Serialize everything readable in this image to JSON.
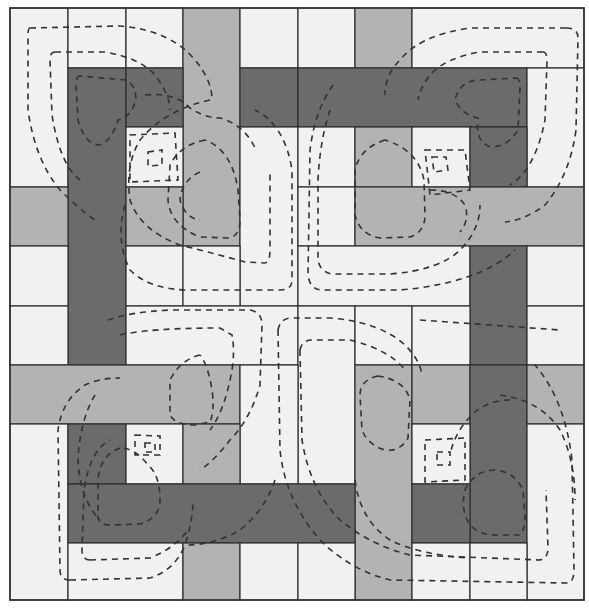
{
  "diagram": {
    "type": "quilt-pattern",
    "caption": "",
    "colors": {
      "white": "#f1f1f1",
      "light": "#b3b3b3",
      "dark": "#6b6b6b",
      "line": "#2e2e2e",
      "stitch": "#333333"
    },
    "grid": {
      "cols": [
        10,
        68,
        126,
        183,
        240,
        298,
        355,
        412,
        470,
        527,
        584
      ],
      "rows": [
        8,
        68,
        127,
        187,
        246,
        306,
        365,
        424,
        484,
        543,
        600
      ]
    },
    "patches": [
      {
        "c": [
          0,
          1
        ],
        "r": [
          0,
          3
        ],
        "t": "white"
      },
      {
        "c": [
          1,
          2
        ],
        "r": [
          0,
          1
        ],
        "t": "white"
      },
      {
        "c": [
          2,
          3
        ],
        "r": [
          0,
          1
        ],
        "t": "white"
      },
      {
        "c": [
          3,
          4
        ],
        "r": [
          0,
          4
        ],
        "t": "light"
      },
      {
        "c": [
          4,
          5
        ],
        "r": [
          0,
          1
        ],
        "t": "white"
      },
      {
        "c": [
          5,
          6
        ],
        "r": [
          0,
          1
        ],
        "t": "white"
      },
      {
        "c": [
          6,
          7
        ],
        "r": [
          0,
          1
        ],
        "t": "light"
      },
      {
        "c": [
          7,
          10
        ],
        "r": [
          0,
          1
        ],
        "t": "white"
      },
      {
        "c": [
          1,
          2
        ],
        "r": [
          1,
          6
        ],
        "t": "dark"
      },
      {
        "c": [
          2,
          3
        ],
        "r": [
          1,
          2
        ],
        "t": "dark"
      },
      {
        "c": [
          4,
          5
        ],
        "r": [
          1,
          2
        ],
        "t": "dark"
      },
      {
        "c": [
          5,
          9
        ],
        "r": [
          1,
          2
        ],
        "t": "dark"
      },
      {
        "c": [
          9,
          10
        ],
        "r": [
          1,
          3
        ],
        "t": "white"
      },
      {
        "c": [
          2,
          3
        ],
        "r": [
          2,
          3
        ],
        "t": "white"
      },
      {
        "c": [
          4,
          5
        ],
        "r": [
          2,
          5
        ],
        "t": "white"
      },
      {
        "c": [
          5,
          6
        ],
        "r": [
          2,
          3
        ],
        "t": "white"
      },
      {
        "c": [
          6,
          7
        ],
        "r": [
          2,
          3
        ],
        "t": "light"
      },
      {
        "c": [
          7,
          8
        ],
        "r": [
          2,
          3
        ],
        "t": "white"
      },
      {
        "c": [
          8,
          9
        ],
        "r": [
          2,
          3
        ],
        "t": "dark"
      },
      {
        "c": [
          0,
          1
        ],
        "r": [
          3,
          4
        ],
        "t": "light"
      },
      {
        "c": [
          2,
          3
        ],
        "r": [
          3,
          4
        ],
        "t": "light"
      },
      {
        "c": [
          5,
          6
        ],
        "r": [
          3,
          4
        ],
        "t": "white"
      },
      {
        "c": [
          6,
          10
        ],
        "r": [
          3,
          4
        ],
        "t": "light"
      },
      {
        "c": [
          0,
          1
        ],
        "r": [
          4,
          5
        ],
        "t": "white"
      },
      {
        "c": [
          2,
          3
        ],
        "r": [
          4,
          5
        ],
        "t": "white"
      },
      {
        "c": [
          3,
          4
        ],
        "r": [
          4,
          5
        ],
        "t": "white"
      },
      {
        "c": [
          5,
          8
        ],
        "r": [
          4,
          5
        ],
        "t": "white"
      },
      {
        "c": [
          8,
          9
        ],
        "r": [
          4,
          6
        ],
        "t": "dark"
      },
      {
        "c": [
          9,
          10
        ],
        "r": [
          4,
          5
        ],
        "t": "white"
      },
      {
        "c": [
          0,
          1
        ],
        "r": [
          5,
          6
        ],
        "t": "white"
      },
      {
        "c": [
          2,
          5
        ],
        "r": [
          5,
          6
        ],
        "t": "white"
      },
      {
        "c": [
          5,
          6
        ],
        "r": [
          5,
          8
        ],
        "t": "white"
      },
      {
        "c": [
          6,
          7
        ],
        "r": [
          5,
          6
        ],
        "t": "white"
      },
      {
        "c": [
          7,
          8
        ],
        "r": [
          5,
          6
        ],
        "t": "white"
      },
      {
        "c": [
          9,
          10
        ],
        "r": [
          5,
          6
        ],
        "t": "white"
      },
      {
        "c": [
          0,
          4
        ],
        "r": [
          6,
          7
        ],
        "t": "light"
      },
      {
        "c": [
          4,
          5
        ],
        "r": [
          6,
          8
        ],
        "t": "white"
      },
      {
        "c": [
          6,
          7
        ],
        "r": [
          6,
          10
        ],
        "t": "light"
      },
      {
        "c": [
          7,
          8
        ],
        "r": [
          6,
          7
        ],
        "t": "light"
      },
      {
        "c": [
          8,
          9
        ],
        "r": [
          6,
          9
        ],
        "t": "dark"
      },
      {
        "c": [
          9,
          10
        ],
        "r": [
          6,
          7
        ],
        "t": "light"
      },
      {
        "c": [
          0,
          1
        ],
        "r": [
          7,
          10
        ],
        "t": "white"
      },
      {
        "c": [
          1,
          2
        ],
        "r": [
          7,
          8
        ],
        "t": "dark"
      },
      {
        "c": [
          2,
          3
        ],
        "r": [
          7,
          8
        ],
        "t": "white"
      },
      {
        "c": [
          3,
          4
        ],
        "r": [
          7,
          8
        ],
        "t": "light"
      },
      {
        "c": [
          7,
          8
        ],
        "r": [
          7,
          8
        ],
        "t": "white"
      },
      {
        "c": [
          9,
          10
        ],
        "r": [
          7,
          10
        ],
        "t": "white"
      },
      {
        "c": [
          1,
          6
        ],
        "r": [
          8,
          9
        ],
        "t": "dark"
      },
      {
        "c": [
          7,
          8
        ],
        "r": [
          8,
          9
        ],
        "t": "dark"
      },
      {
        "c": [
          1,
          3
        ],
        "r": [
          9,
          10
        ],
        "t": "white"
      },
      {
        "c": [
          3,
          4
        ],
        "r": [
          9,
          10
        ],
        "t": "light"
      },
      {
        "c": [
          4,
          5
        ],
        "r": [
          9,
          10
        ],
        "t": "white"
      },
      {
        "c": [
          5,
          6
        ],
        "r": [
          9,
          10
        ],
        "t": "white"
      },
      {
        "c": [
          7,
          8
        ],
        "r": [
          9,
          10
        ],
        "t": "white"
      },
      {
        "c": [
          8,
          9
        ],
        "r": [
          9,
          10
        ],
        "t": "white"
      }
    ],
    "stitch_paths": [
      "M 30 28 Q 28 28 28 36 L 28 110 Q 35 160 60 190 Q 80 210 95 220",
      "M 30 28 L 120 26 Q 170 30 195 60 Q 212 80 212 100",
      "M 55 52 Q 50 52 50 60 L 52 115 Q 60 165 80 180",
      "M 55 52 L 105 52 Q 140 58 155 75 Q 170 95 170 110",
      "M 80 76 Q 76 76 76 85 L 78 120 Q 85 145 100 145 Q 112 140 118 120 Q 130 118 136 100 Q 136 85 126 80 Z",
      "M 145 95 Q 175 92 190 108 Q 205 118 220 118 Q 245 125 256 150",
      "M 130 135 L 175 133 L 178 180 L 130 182 Z",
      "M 148 152 L 162 150 L 162 165 L 148 166 Z",
      "M 205 140 Q 180 145 170 165 L 168 200 Q 170 225 200 237 L 230 238 Q 240 235 240 220 L 238 190 Q 232 150 205 140",
      "M 200 172 Q 182 180 180 200 Q 185 218 200 220",
      "M 210 100 Q 165 110 140 140 Q 125 165 130 200 Q 140 230 180 245 Q 220 255 245 262 L 265 263 Q 270 262 270 250 L 270 170",
      "M 125 205 Q 115 240 130 270 Q 150 290 190 290 L 280 290 Q 292 290 292 280 L 292 170 Q 285 125 255 110",
      "M 566 28 Q 578 28 578 38 L 576 130 Q 570 175 545 205 Q 525 220 505 222",
      "M 566 28 L 470 28 Q 420 35 400 60 Q 385 75 385 95",
      "M 543 52 Q 547 52 547 60 L 545 120 Q 535 170 510 185",
      "M 543 52 L 480 52 Q 445 58 430 75 Q 420 88 418 100",
      "M 516 78 Q 520 78 520 88 L 518 130 Q 505 150 488 146 Q 475 140 478 118 Q 462 115 455 100 Q 460 80 480 80 Z",
      "M 420 320 L 560 330",
      "M 425 150 L 465 150 L 470 190 L 430 195 Z",
      "M 432 157 L 446 157 L 448 170 L 434 172 Z",
      "M 385 140 Q 360 148 355 170 L 355 215 Q 360 235 380 238 L 410 237 Q 425 232 425 215 L 424 180 Q 418 150 385 140",
      "M 430 190 Q 455 190 465 205 Q 470 220 460 232",
      "M 330 110 Q 320 140 318 180 L 318 260 Q 320 272 332 274 L 390 274 Q 440 270 460 250 Q 480 230 480 205",
      "M 333 85 Q 315 110 310 150 L 308 275 Q 310 290 322 290 L 400 290 Q 480 283 515 250",
      "M 70 580 Q 60 580 60 570 L 58 430 Q 62 400 85 385 Q 100 378 120 378",
      "M 70 580 L 150 578 Q 175 570 185 545 Q 193 520 193 500",
      "M 90 560 Q 82 560 82 550 L 84 490 Q 90 450 110 440",
      "M 90 560 L 150 558 Q 175 548 188 530",
      "M 120 448 Q 100 455 98 480 L 98 518 Q 100 525 110 525 L 140 524 Q 160 518 160 500 Q 160 475 148 465 Q 135 448 120 448",
      "M 135 435 L 160 436 L 160 455 L 135 455 Z",
      "M 145 443 L 155 443 L 155 452 L 145 452 Z",
      "M 200 355 Q 180 360 170 380 L 170 415 Q 175 425 195 425 L 210 422 Q 215 410 212 390 Q 208 365 200 355",
      "M 108 320 Q 130 312 170 310 L 250 310 Q 262 312 262 325 L 260 385 Q 250 420 230 440 Q 215 460 200 470",
      "M 120 335 Q 150 328 220 328 L 232 335 Q 235 350 232 370 Q 225 410 210 430",
      "M 95 395 Q 80 420 78 460 Q 80 500 100 520",
      "M 275 480 Q 265 510 240 530 Q 215 545 185 545",
      "M 278 330 Q 280 318 292 318 L 330 318 Q 380 322 405 345 Q 420 360 422 375",
      "M 300 350 Q 302 340 312 340 L 350 340 Q 390 350 405 370",
      "M 278 330 L 280 450 Q 285 500 320 540 Q 350 570 390 580 L 566 583 Q 574 583 574 570 L 572 460 Q 565 400 535 365",
      "M 300 350 L 302 440 Q 310 490 340 520 Q 370 545 410 555 L 540 560 Q 548 558 548 548 L 546 490",
      "M 378 376 Q 360 380 360 395 L 362 430 Q 368 445 385 450 Q 400 452 408 438 L 410 400 Q 405 380 378 376",
      "M 425 440 L 465 438 L 465 480 L 425 482 Z",
      "M 437 452 L 450 452 L 450 465 L 437 465 Z",
      "M 495 470 Q 475 470 465 490 Q 460 510 470 525 Q 480 535 495 535 L 520 535 Q 525 530 525 515 L 523 490 Q 515 472 495 470",
      "M 510 400 Q 490 400 475 412 Q 455 430 450 455",
      "M 500 395 Q 540 400 560 430 Q 575 460 575 500",
      "M 355 480 Q 360 520 390 540 Q 420 555 470 558"
    ]
  }
}
